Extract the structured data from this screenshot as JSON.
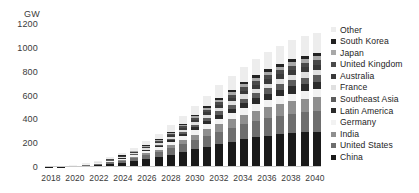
{
  "chart_data": {
    "type": "bar",
    "stacked": true,
    "title": "",
    "xlabel": "",
    "ylabel": "GW",
    "ylim": [
      0,
      1200
    ],
    "yticks": [
      0,
      200,
      400,
      600,
      800,
      1000,
      1200
    ],
    "ytick_labels": [
      "0",
      "200",
      "400",
      "600",
      "800",
      "1000",
      "1200"
    ],
    "grid": false,
    "legend_position": "right",
    "x": [
      2018,
      2019,
      2020,
      2021,
      2022,
      2023,
      2024,
      2025,
      2026,
      2027,
      2028,
      2029,
      2030,
      2031,
      2032,
      2033,
      2034,
      2035,
      2036,
      2037,
      2038,
      2039,
      2040
    ],
    "xtick_labels": [
      "2018",
      "2020",
      "2022",
      "2024",
      "2026",
      "2028",
      "2030",
      "2032",
      "2034",
      "2036",
      "2038",
      "2040"
    ],
    "xticks": [
      2018,
      2020,
      2022,
      2024,
      2026,
      2028,
      2030,
      2032,
      2034,
      2036,
      2038,
      2040
    ],
    "series": [
      {
        "name": "China",
        "color": "#1a1a1a",
        "values": [
          2,
          4,
          7,
          12,
          18,
          26,
          36,
          50,
          66,
          84,
          104,
          126,
          150,
          172,
          194,
          214,
          232,
          248,
          262,
          274,
          284,
          292,
          298
        ]
      },
      {
        "name": "United States",
        "color": "#6e6e6e",
        "values": [
          1,
          2,
          3,
          5,
          8,
          12,
          17,
          24,
          32,
          42,
          53,
          65,
          78,
          91,
          104,
          116,
          127,
          137,
          146,
          154,
          161,
          167,
          172
        ]
      },
      {
        "name": "India",
        "color": "#8f8f8f",
        "values": [
          0,
          0,
          1,
          2,
          3,
          5,
          8,
          11,
          16,
          21,
          28,
          35,
          44,
          53,
          62,
          71,
          80,
          88,
          96,
          103,
          109,
          114,
          118
        ]
      },
      {
        "name": "Germany",
        "color": "#f2f2f2",
        "values": [
          1,
          1,
          2,
          3,
          5,
          7,
          10,
          13,
          17,
          21,
          26,
          31,
          36,
          41,
          45,
          49,
          53,
          56,
          59,
          61,
          63,
          64,
          65
        ]
      },
      {
        "name": "Latin America",
        "color": "#2b2b2b",
        "values": [
          0,
          0,
          1,
          1,
          2,
          3,
          5,
          7,
          9,
          12,
          16,
          20,
          25,
          30,
          35,
          40,
          45,
          49,
          53,
          57,
          60,
          62,
          64
        ]
      },
      {
        "name": "Southeast Asia",
        "color": "#5c5c5c",
        "values": [
          0,
          0,
          0,
          1,
          1,
          2,
          3,
          5,
          7,
          9,
          12,
          15,
          19,
          23,
          27,
          32,
          36,
          40,
          44,
          47,
          50,
          52,
          54
        ]
      },
      {
        "name": "France",
        "color": "#e0e0e0",
        "values": [
          0,
          1,
          1,
          2,
          3,
          4,
          6,
          8,
          10,
          13,
          16,
          19,
          23,
          26,
          30,
          33,
          36,
          39,
          41,
          43,
          45,
          46,
          47
        ]
      },
      {
        "name": "Australia",
        "color": "#3a3a3a",
        "values": [
          0,
          0,
          1,
          1,
          2,
          3,
          4,
          6,
          8,
          10,
          13,
          16,
          19,
          22,
          25,
          28,
          31,
          34,
          36,
          38,
          40,
          41,
          42
        ]
      },
      {
        "name": "United Kingdom",
        "color": "#4a4a4a",
        "values": [
          0,
          0,
          1,
          1,
          2,
          3,
          4,
          5,
          7,
          9,
          11,
          14,
          17,
          20,
          23,
          25,
          28,
          30,
          32,
          34,
          35,
          36,
          37
        ]
      },
      {
        "name": "Japan",
        "color": "#a8a8a8",
        "values": [
          0,
          0,
          0,
          1,
          1,
          2,
          3,
          4,
          6,
          8,
          10,
          12,
          15,
          17,
          20,
          22,
          25,
          27,
          29,
          30,
          32,
          33,
          34
        ]
      },
      {
        "name": "South Korea",
        "color": "#222222",
        "values": [
          0,
          0,
          0,
          1,
          1,
          2,
          2,
          3,
          5,
          6,
          8,
          10,
          12,
          14,
          17,
          19,
          21,
          23,
          25,
          26,
          28,
          29,
          30
        ]
      },
      {
        "name": "Other",
        "color": "#ededed",
        "values": [
          1,
          2,
          3,
          5,
          8,
          12,
          17,
          24,
          32,
          42,
          53,
          65,
          78,
          91,
          104,
          116,
          127,
          137,
          146,
          153,
          159,
          164,
          168
        ]
      }
    ],
    "totals": [
      5,
      10,
      20,
      35,
      54,
      81,
      115,
      160,
      215,
      277,
      350,
      428,
      516,
      600,
      686,
      765,
      841,
      908,
      969,
      1020,
      1066,
      1100,
      1129
    ]
  },
  "legend": {
    "items": [
      {
        "label": "Other",
        "color": "#ededed"
      },
      {
        "label": "South Korea",
        "color": "#222222"
      },
      {
        "label": "Japan",
        "color": "#a8a8a8"
      },
      {
        "label": "United Kingdom",
        "color": "#4a4a4a"
      },
      {
        "label": "Australia",
        "color": "#3a3a3a"
      },
      {
        "label": "France",
        "color": "#e0e0e0"
      },
      {
        "label": "Southeast Asia",
        "color": "#5c5c5c"
      },
      {
        "label": "Latin America",
        "color": "#2b2b2b"
      },
      {
        "label": "Germany",
        "color": "#f2f2f2"
      },
      {
        "label": "India",
        "color": "#8f8f8f"
      },
      {
        "label": "United States",
        "color": "#6e6e6e"
      },
      {
        "label": "China",
        "color": "#1a1a1a"
      }
    ]
  }
}
